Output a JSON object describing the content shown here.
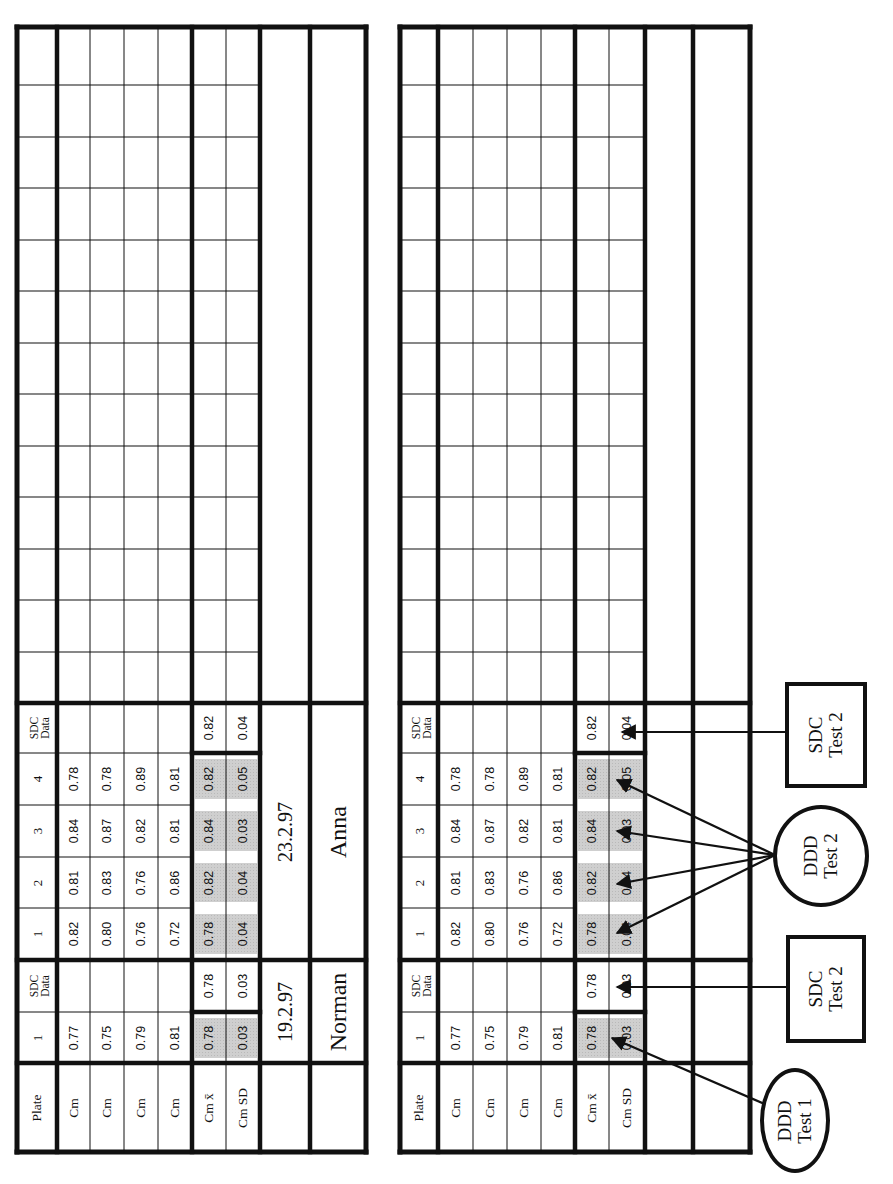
{
  "document": {
    "orientation": "rotated-90-ccw",
    "colors": {
      "ink": "#111111",
      "shade": "#cfcfcf",
      "paper": "#ffffff"
    }
  },
  "tables": [
    {
      "id": "left",
      "row_labels": {
        "plate": "Plate",
        "cm": [
          "Cm",
          "Cm",
          "Cm",
          "Cm"
        ],
        "mean": "Cm x̄",
        "sd": "Cm SD"
      },
      "group1": {
        "plate_header": "1",
        "sdc_header": "SDC Data",
        "cm_values": [
          "0.77",
          "0.75",
          "0.79",
          "0.81"
        ],
        "mean": "0.78",
        "sd": "0.03",
        "sdc_mean": "0.78",
        "sdc_sd": "0.03",
        "date": "19.2.97",
        "name": "Norman"
      },
      "group2": {
        "plate_headers": [
          "1",
          "2",
          "3",
          "4"
        ],
        "sdc_header": "SDC Data",
        "cm_values": [
          [
            "0.82",
            "0.80",
            "0.76",
            "0.72"
          ],
          [
            "0.81",
            "0.83",
            "0.76",
            "0.86"
          ],
          [
            "0.84",
            "0.87",
            "0.82",
            "0.81"
          ],
          [
            "0.78",
            "0.78",
            "0.89",
            "0.81"
          ]
        ],
        "means": [
          "0.78",
          "0.82",
          "0.84",
          "0.82"
        ],
        "sds": [
          "0.04",
          "0.04",
          "0.03",
          "0.05"
        ],
        "sdc_mean": "0.82",
        "sdc_sd": "0.04",
        "date": "23.2.97",
        "name": "Anna"
      }
    },
    {
      "id": "right",
      "row_labels": {
        "plate": "Plate",
        "cm": [
          "Cm",
          "Cm",
          "Cm",
          "Cm"
        ],
        "mean": "Cm x̄",
        "sd": "Cm SD"
      },
      "group1": {
        "plate_header": "1",
        "sdc_header": "SDC Data",
        "cm_values": [
          "0.77",
          "0.75",
          "0.79",
          "0.81"
        ],
        "mean": "0.78",
        "sd": "0.03",
        "sdc_mean": "0.78",
        "sdc_sd": "0.03"
      },
      "group2": {
        "plate_headers": [
          "1",
          "2",
          "3",
          "4"
        ],
        "sdc_header": "SDC Data",
        "cm_values": [
          [
            "0.82",
            "0.80",
            "0.76",
            "0.72"
          ],
          [
            "0.81",
            "0.83",
            "0.76",
            "0.86"
          ],
          [
            "0.84",
            "0.87",
            "0.82",
            "0.81"
          ],
          [
            "0.78",
            "0.78",
            "0.89",
            "0.81"
          ]
        ],
        "means": [
          "0.78",
          "0.82",
          "0.84",
          "0.82"
        ],
        "sds": [
          "0.04",
          "0.04",
          "0.03",
          "0.05"
        ],
        "sdc_mean": "0.82",
        "sdc_sd": "0.04"
      }
    }
  ],
  "annotations": {
    "ddd_test1": {
      "line1": "DDD",
      "line2": "Test 1"
    },
    "sdc_test2_a": {
      "line1": "SDC",
      "line2": "Test 2"
    },
    "ddd_test2": {
      "line1": "DDD",
      "line2": "Test 2"
    },
    "sdc_test2_b": {
      "line1": "SDC",
      "line2": "Test 2"
    }
  }
}
